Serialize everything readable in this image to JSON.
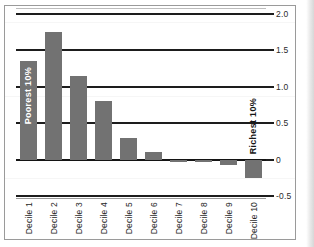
{
  "figure": {
    "frame_color": "#9a9a9a",
    "bar_color": "#727272",
    "axis_color": "#1d1d1d",
    "background": "#ffffff"
  },
  "annotations": {
    "poorest": "Poorest 10%",
    "richest": "Richest 10%"
  },
  "chart_data": {
    "type": "bar",
    "title": "",
    "xlabel": "",
    "ylabel": "",
    "grid": true,
    "legend": null,
    "ylim": [
      -0.5,
      2.0
    ],
    "yticks": [
      2.0,
      1.5,
      1.0,
      0.5,
      0,
      -0.5
    ],
    "ytick_labels": [
      "2.0",
      "1.5",
      "1.0",
      "0.5",
      "0",
      "-0.5"
    ],
    "categories": [
      "Decile 1",
      "Decile 2",
      "Decile 3",
      "Decile 4",
      "Decile 5",
      "Decile 6",
      "Decile 7",
      "Decile 8",
      "Decile 9",
      "Decile 10"
    ],
    "values": [
      1.35,
      1.75,
      1.15,
      0.8,
      0.3,
      0.1,
      -0.02,
      -0.03,
      -0.07,
      -0.25
    ],
    "annotations": [
      {
        "text": "Poorest 10%",
        "category": "Decile 1",
        "color": "#ffffff"
      },
      {
        "text": "Richest 10%",
        "category": "Decile 10",
        "color": "#161616"
      }
    ]
  }
}
